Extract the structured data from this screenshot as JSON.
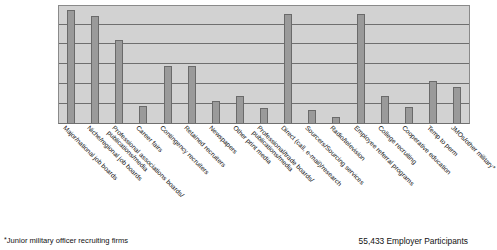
{
  "chart_data": {
    "type": "bar",
    "title": "",
    "xlabel": "",
    "ylabel": "",
    "ylim": [
      0,
      120
    ],
    "grid": true,
    "gridlines": [
      20,
      40,
      60,
      80,
      100,
      120
    ],
    "legend": "none",
    "categories": [
      "Major/national job boards",
      "Niche/regional job boards",
      "Professional associations boards/ publications/media",
      "Career fairs",
      "Contingency recruiters",
      "Retained recruiters",
      "Newspapers",
      "Other print media",
      "Professional/trade boards/ publications/media",
      "Direct (call, e-mail)/research",
      "Sourcers/Sourcing services",
      "Radio/television",
      "Employee referral programs",
      "College recruiting",
      "Cooperative education",
      "Temp to perm",
      "JMOs/other military*"
    ],
    "category_lines": [
      [
        "Major/national job boards"
      ],
      [
        "Niche/regional job boards"
      ],
      [
        "Professional associations boards/",
        "publications/media"
      ],
      [
        "Career fairs"
      ],
      [
        "Contingency recruiters"
      ],
      [
        "Retained recruiters"
      ],
      [
        "Newspapers"
      ],
      [
        "Other print media"
      ],
      [
        "Professional/trade boards/",
        "publications/media"
      ],
      [
        "Direct (call, e-mail)/research"
      ],
      [
        "Sourcers/Sourcing services"
      ],
      [
        "Radio/television"
      ],
      [
        "Employee referral programs"
      ],
      [
        "College recruiting"
      ],
      [
        "Cooperative education"
      ],
      [
        "Temp to perm"
      ],
      [
        "JMOs/other military*"
      ]
    ],
    "values": [
      114,
      108,
      84,
      17,
      57,
      57,
      22,
      27,
      15,
      110,
      13,
      6,
      110,
      27,
      16,
      42,
      36
    ]
  },
  "footer": {
    "footnote_star": "*",
    "footnote_text": "Junior military officer recruiting firms",
    "participants": "55,433 Employer Participants"
  }
}
